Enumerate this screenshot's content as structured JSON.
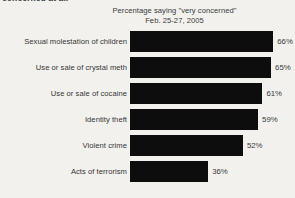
{
  "clipped_fragment_above": "concerned at all",
  "chart_data": {
    "type": "bar",
    "orientation": "horizontal",
    "title": "Percentage saying \"very concerned\"",
    "subtitle": "Feb. 25-27, 2005",
    "xlabel": "",
    "ylabel": "",
    "xlim": [
      0,
      76
    ],
    "grid": false,
    "legend": false,
    "value_suffix": "%",
    "bar_color": "#0d0d0d",
    "background_color": "#f2f1ee",
    "categories": [
      "Sexual molestation of children",
      "Use or sale of crystal meth",
      "Use or sale of cocaine",
      "Identity theft",
      "Violent crime",
      "Acts of terrorism"
    ],
    "values": [
      66,
      65,
      61,
      59,
      52,
      36
    ],
    "value_labels": [
      "66%",
      "65%",
      "61%",
      "59%",
      "52%",
      "36%"
    ]
  }
}
